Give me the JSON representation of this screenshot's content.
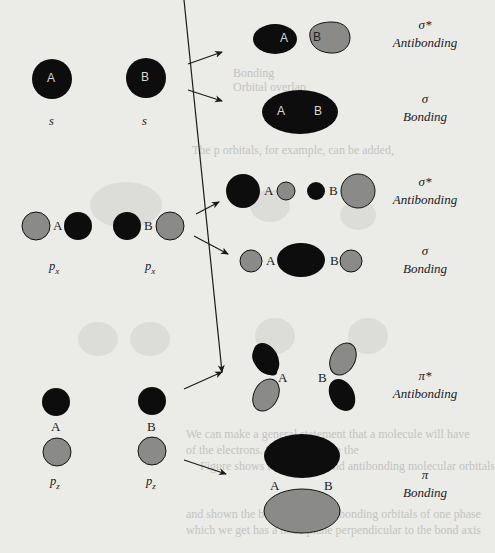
{
  "figure": {
    "colors": {
      "positive_lobe": "#0d0d0d",
      "negative_lobe": "#8a8a88",
      "background": "#ebebe8",
      "text": "#1a1a1a"
    },
    "rows": [
      {
        "id": "s",
        "atomic_orbitals": [
          {
            "atom": "A",
            "label": "s"
          },
          {
            "atom": "B",
            "label": "s"
          }
        ],
        "antibonding": {
          "symbol": "σ*",
          "name": "Antibonding",
          "atoms": [
            "A",
            "B"
          ]
        },
        "bonding": {
          "symbol": "σ",
          "name": "Bonding",
          "atoms": [
            "A",
            "B"
          ]
        }
      },
      {
        "id": "px",
        "atomic_orbitals": [
          {
            "atom": "A",
            "label": "p",
            "subscript": "x"
          },
          {
            "atom": "B",
            "label": "p",
            "subscript": "x"
          }
        ],
        "antibonding": {
          "symbol": "σ*",
          "name": "Antibonding",
          "atoms": [
            "A",
            "B"
          ]
        },
        "bonding": {
          "symbol": "σ",
          "name": "Bonding",
          "atoms": [
            "A",
            "B"
          ]
        }
      },
      {
        "id": "pz",
        "atomic_orbitals": [
          {
            "atom": "A",
            "label": "p",
            "subscript": "z"
          },
          {
            "atom": "B",
            "label": "p",
            "subscript": "z"
          }
        ],
        "antibonding": {
          "symbol": "π*",
          "name": "Antibonding",
          "atoms": [
            "A",
            "B"
          ]
        },
        "bonding": {
          "symbol": "π",
          "name": "Bonding",
          "atoms": [
            "A",
            "B"
          ]
        }
      }
    ],
    "bleed_through_text": [
      "Bonding",
      "Orbital overlap",
      "The p orbitals, for example, can be added,",
      "We can make a general statement that a molecule will have",
      "of the electrons. The orbitals are the",
      "Figure shows the bonding and antibonding molecular orbitals",
      "and shown the bonding and antibonding orbitals of one phase",
      "which we get has a node plane perpendicular to the bond axis"
    ]
  }
}
